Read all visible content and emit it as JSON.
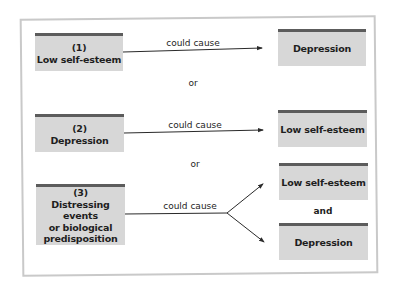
{
  "diagram": {
    "colors": {
      "box_fill": "#d7d7d7",
      "box_top_bar": "#5c5c5c",
      "frame_border": "#c9c9c9",
      "line": "#2a2a2a",
      "text": "#1e1e1e"
    },
    "rows": [
      {
        "cause": {
          "number": "(1)",
          "lines": [
            "Low self-esteem"
          ]
        },
        "relation": "could cause",
        "effects": [
          "Depression"
        ]
      },
      {
        "cause": {
          "number": "(2)",
          "lines": [
            "Depression"
          ]
        },
        "relation": "could cause",
        "effects": [
          "Low self-esteem"
        ]
      },
      {
        "cause": {
          "number": "(3)",
          "lines": [
            "Distressing events",
            "or biological",
            "predisposition"
          ]
        },
        "relation": "could cause",
        "effects": [
          "Low self-esteem",
          "Depression"
        ],
        "effects_joiner": "and"
      }
    ],
    "separators": [
      "or",
      "or"
    ]
  }
}
